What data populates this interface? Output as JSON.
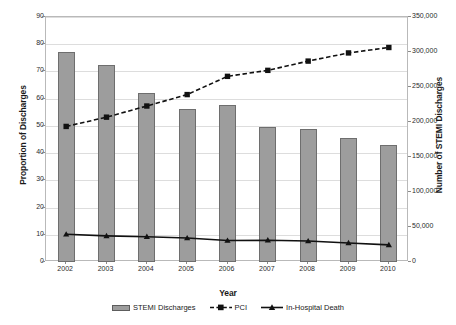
{
  "chart_data": {
    "type": "bar",
    "title": "",
    "xlabel": "Year",
    "ylabel": "Proportion of Discharges",
    "ylabel_right": "Number of STEMI Discharges",
    "categories": [
      "2002",
      "2003",
      "2004",
      "2005",
      "2006",
      "2007",
      "2008",
      "2009",
      "2010"
    ],
    "ylim": [
      0,
      90
    ],
    "yticks": [
      "0",
      "10",
      "20",
      "30",
      "40",
      "50",
      "60",
      "70",
      "80",
      "90"
    ],
    "ylim_right": [
      0,
      350000
    ],
    "yticks_right": [
      "0",
      "50,000",
      "100,000",
      "150,000",
      "200,000",
      "250,000",
      "300,000",
      "350,000"
    ],
    "grid": true,
    "legend_position": "bottom",
    "series": [
      {
        "name": "STEMI Discharges",
        "kind": "bar",
        "axis": "right",
        "values": [
          300000,
          281000,
          242000,
          219000,
          224000,
          193000,
          191000,
          177000,
          168000
        ],
        "values_left_scale": [
          77.0,
          72.2,
          62.2,
          56.3,
          57.7,
          49.5,
          49.0,
          45.5,
          43.1
        ]
      },
      {
        "name": "PCI",
        "kind": "line-dashed",
        "axis": "left",
        "values": [
          49.8,
          53.2,
          57.3,
          61.5,
          68.2,
          70.4,
          73.8,
          76.8,
          78.8
        ]
      },
      {
        "name": "In-Hospital Death",
        "kind": "line-solid",
        "axis": "left",
        "values": [
          10.2,
          9.6,
          9.3,
          8.8,
          7.9,
          8.0,
          7.7,
          7.0,
          6.3
        ]
      }
    ]
  },
  "legend": {
    "items": [
      {
        "label": "STEMI Discharges",
        "marker": "bar-swatch",
        "color": "#9d9d9d"
      },
      {
        "label": "PCI",
        "marker": "dashed-square",
        "color": "#111111"
      },
      {
        "label": "In-Hospital Death",
        "marker": "solid-triangle",
        "color": "#111111"
      }
    ]
  },
  "caption": {
    "text": ""
  },
  "colors": {
    "bar_fill": "#9d9d9d",
    "bar_stroke": "#6e6e6e",
    "line": "#111111",
    "grid": "#dddddd",
    "frame": "#b9b9b9"
  }
}
